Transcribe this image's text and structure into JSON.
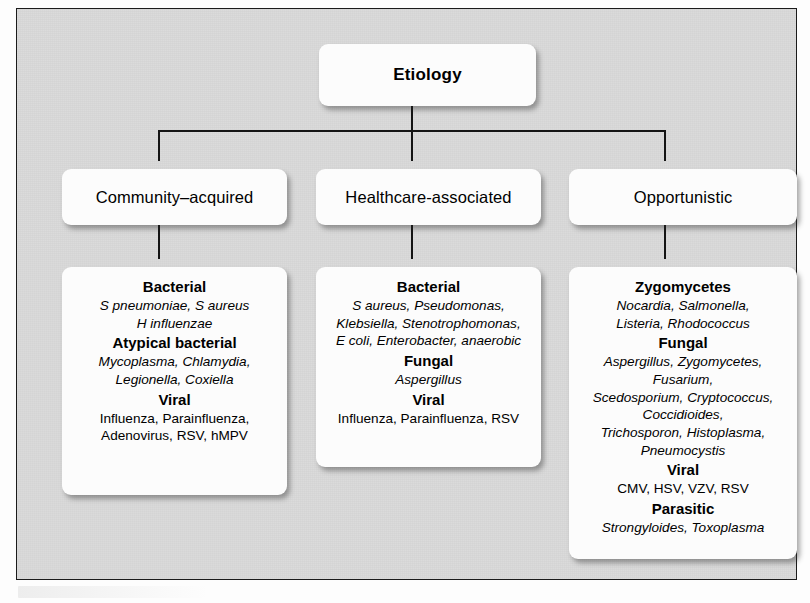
{
  "figure": {
    "background_color": "#d9d9d9",
    "border_color": "#1b1b1b",
    "box_color": "#fcfcfc",
    "text_color": "#000000"
  },
  "root": {
    "label": "Etiology"
  },
  "categories": [
    {
      "label": "Community–acquired"
    },
    {
      "label": "Healthcare-associated"
    },
    {
      "label": "Opportunistic"
    }
  ],
  "details": [
    {
      "groups": [
        {
          "heading": "Bacterial",
          "items": [
            {
              "text": "S pneumoniae, S aureus",
              "style": "italic"
            },
            {
              "text": "H influenzae",
              "style": "italic"
            }
          ]
        },
        {
          "heading": "Atypical bacterial",
          "items": [
            {
              "text": "Mycoplasma, Chlamydia,",
              "style": "italic"
            },
            {
              "text": "Legionella, Coxiella",
              "style": "italic"
            }
          ]
        },
        {
          "heading": "Viral",
          "items": [
            {
              "text": "Influenza, Parainfluenza,",
              "style": "upright"
            },
            {
              "text": "Adenovirus, RSV, hMPV",
              "style": "upright"
            }
          ]
        }
      ]
    },
    {
      "groups": [
        {
          "heading": "Bacterial",
          "items": [
            {
              "text": "S aureus, Pseudomonas,",
              "style": "italic"
            },
            {
              "text": "Klebsiella, Stenotrophomonas,",
              "style": "italic"
            },
            {
              "text": "E coli, Enterobacter, anaerobic",
              "style": "italic"
            }
          ]
        },
        {
          "heading": "Fungal",
          "items": [
            {
              "text": "Aspergillus",
              "style": "italic"
            }
          ]
        },
        {
          "heading": "Viral",
          "items": [
            {
              "text": "Influenza, Parainfluenza, RSV",
              "style": "upright"
            }
          ]
        }
      ]
    },
    {
      "groups": [
        {
          "heading": "Zygomycetes",
          "items": [
            {
              "text": "Nocardia, Salmonella,",
              "style": "italic"
            },
            {
              "text": "Listeria, Rhodococcus",
              "style": "italic"
            }
          ]
        },
        {
          "heading": "Fungal",
          "items": [
            {
              "text": "Aspergillus, Zygomycetes,",
              "style": "italic"
            },
            {
              "text": "Fusarium,",
              "style": "italic"
            },
            {
              "text": "Scedosporium, Cryptococcus,",
              "style": "italic"
            },
            {
              "text": "Coccidioides,",
              "style": "italic"
            },
            {
              "text": "Trichosporon, Histoplasma,",
              "style": "italic"
            },
            {
              "text": "Pneumocystis",
              "style": "italic"
            }
          ]
        },
        {
          "heading": "Viral",
          "items": [
            {
              "text": "CMV, HSV, VZV, RSV",
              "style": "upright"
            }
          ]
        },
        {
          "heading": "Parasitic",
          "items": [
            {
              "text": "Strongyloides, Toxoplasma",
              "style": "italic"
            }
          ]
        }
      ]
    }
  ]
}
